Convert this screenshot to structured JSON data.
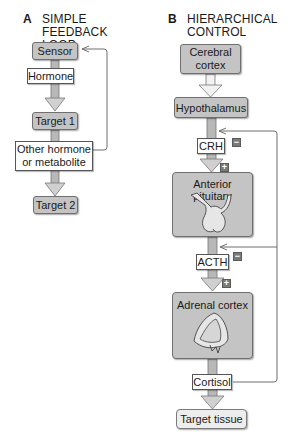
{
  "panel_a": {
    "letter": "A",
    "title": "SIMPLE FEEDBACK\nLOOP",
    "nodes": {
      "sensor": "Sensor",
      "hormone": "Hormone",
      "target1": "Target 1",
      "other": "Other hormone\nor metabolite",
      "target2": "Target 2"
    }
  },
  "panel_b": {
    "letter": "B",
    "title": "HIERARCHICAL\nCONTROL",
    "nodes": {
      "cerebral_cortex": "Cerebral\ncortex",
      "hypothalamus": "Hypothalamus",
      "crh": "CRH",
      "anterior_pituitary": "Anterior pituitary",
      "acth": "ACTH",
      "adrenal_cortex": "Adrenal cortex",
      "cortisol": "Cortisol",
      "target_tissue": "Target tissue"
    },
    "signs": {
      "crh_minus": "−",
      "crh_plus": "+",
      "acth_minus": "−",
      "acth_plus": "+"
    }
  },
  "colors": {
    "node_gray": "#c4c4c4",
    "node_light": "#ededed",
    "arrow_gray": "#b0b0b0",
    "line": "#6f6f6f",
    "sign": "#7a7a7a"
  }
}
